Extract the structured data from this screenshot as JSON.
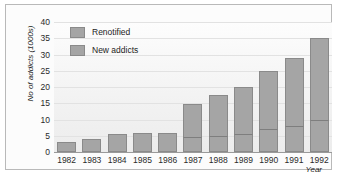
{
  "chart_data": {
    "type": "bar",
    "subtype": "stacked-vertical",
    "title": "",
    "xlabel": "Year",
    "ylabel": "No of addicts (1000s)",
    "ylim": [
      0,
      40
    ],
    "yticks": [
      0,
      5,
      10,
      15,
      20,
      25,
      30,
      35,
      40
    ],
    "ytick_labels": [
      "0",
      "5",
      "10",
      "15",
      "20",
      "25",
      "30",
      "35",
      "40"
    ],
    "grid": true,
    "grid_axis": "y",
    "legend_position": "upper-left-inside",
    "categories": [
      "1982",
      "1983",
      "1984",
      "1985",
      "1986",
      "1987",
      "1988",
      "1989",
      "1990",
      "1991",
      "1992"
    ],
    "series": [
      {
        "name": "New addicts",
        "stack_position": "bottom",
        "color": "#a5a5a5",
        "values": [
          3.0,
          4.0,
          5.5,
          6.0,
          5.7,
          4.5,
          5.0,
          5.5,
          7.2,
          8.0,
          10.0
        ]
      },
      {
        "name": "Renotified",
        "stack_position": "top",
        "color": "#a5a5a5",
        "values": [
          0,
          0,
          0,
          0,
          0,
          10.2,
          12.5,
          14.5,
          17.8,
          21.0,
          25.0
        ]
      }
    ],
    "totals": [
      3.0,
      4.0,
      5.5,
      6.0,
      5.7,
      14.7,
      17.5,
      20.0,
      25.0,
      29.0,
      35.0
    ]
  },
  "legend": {
    "entries": [
      {
        "label": "Renotified"
      },
      {
        "label": "New addicts"
      }
    ]
  },
  "colors": {
    "bar_fill": "#a5a5a5",
    "bar_stroke": "#8a8a8a",
    "gridline": "#e2e2e2",
    "axis": "#9a9a9a",
    "frame": "#b9b9b9",
    "text": "#1d1d1d"
  }
}
